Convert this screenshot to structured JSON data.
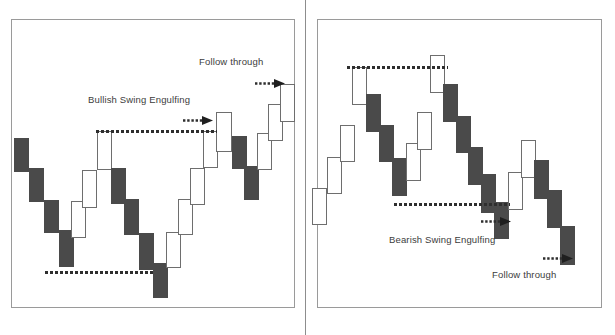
{
  "figure": {
    "title_left": "Bullish Swing Engulfing",
    "title_right": "Bearish Swing Engulfing",
    "follow_through_left": "Follow through",
    "follow_through_right": "Follow through",
    "colors": {
      "up_fill": "#ffffff",
      "up_border": "#6e6e6e",
      "down_fill": "#4a4a4a",
      "line": "#2e2e2e",
      "panel_border": "#9a9a9a",
      "text": "#3c3c3c"
    }
  },
  "chart_data": [
    {
      "type": "bar",
      "title": "Bullish Swing Engulfing",
      "panel": "left",
      "xlabel": "",
      "ylabel": "",
      "grid": false,
      "legend": "none",
      "notes": [
        {
          "text": "Bullish Swing Engulfing",
          "x": 88,
          "y": 94
        },
        {
          "text": "Follow through",
          "x": 199,
          "y": 56
        }
      ],
      "annotations": [
        {
          "kind": "dashed-level",
          "name": "swing-high-level",
          "x1": 96,
          "x2": 217,
          "y": 130
        },
        {
          "kind": "dashed-level",
          "name": "swing-low-level",
          "x1": 45,
          "x2": 155,
          "y": 271
        },
        {
          "kind": "arrow",
          "name": "engulfing-arrow",
          "x": 183,
          "y": 115,
          "direction": "right"
        },
        {
          "kind": "arrow",
          "name": "follow-through-arrow",
          "x": 255,
          "y": 78,
          "direction": "right"
        }
      ],
      "candles": [
        {
          "i": 1,
          "dir": "down",
          "x": 14,
          "y": 138,
          "w": 15,
          "h": 34
        },
        {
          "i": 2,
          "dir": "down",
          "x": 29,
          "y": 168,
          "w": 15,
          "h": 34
        },
        {
          "i": 3,
          "dir": "down",
          "x": 44,
          "y": 200,
          "w": 15,
          "h": 33
        },
        {
          "i": 4,
          "dir": "down",
          "x": 59,
          "y": 230,
          "w": 15,
          "h": 37
        },
        {
          "i": 5,
          "dir": "up",
          "x": 71,
          "y": 201,
          "w": 15,
          "h": 37
        },
        {
          "i": 6,
          "dir": "up",
          "x": 82,
          "y": 170,
          "w": 15,
          "h": 38
        },
        {
          "i": 7,
          "dir": "up",
          "x": 97,
          "y": 131,
          "w": 15,
          "h": 39
        },
        {
          "i": 8,
          "dir": "down",
          "x": 111,
          "y": 168,
          "w": 15,
          "h": 36
        },
        {
          "i": 9,
          "dir": "down",
          "x": 124,
          "y": 199,
          "w": 15,
          "h": 36
        },
        {
          "i": 10,
          "dir": "down",
          "x": 139,
          "y": 233,
          "w": 15,
          "h": 37
        },
        {
          "i": 11,
          "dir": "down",
          "x": 153,
          "y": 263,
          "w": 15,
          "h": 35
        },
        {
          "i": 12,
          "dir": "up",
          "x": 166,
          "y": 232,
          "w": 15,
          "h": 36
        },
        {
          "i": 13,
          "dir": "up",
          "x": 178,
          "y": 199,
          "w": 15,
          "h": 36
        },
        {
          "i": 14,
          "dir": "up",
          "x": 190,
          "y": 168,
          "w": 15,
          "h": 37
        },
        {
          "i": 15,
          "dir": "up",
          "x": 203,
          "y": 131,
          "w": 15,
          "h": 37
        },
        {
          "i": 16,
          "dir": "up",
          "x": 216,
          "y": 112,
          "w": 16,
          "h": 40
        },
        {
          "i": 17,
          "dir": "down",
          "x": 232,
          "y": 136,
          "w": 15,
          "h": 33
        },
        {
          "i": 18,
          "dir": "down",
          "x": 244,
          "y": 166,
          "w": 15,
          "h": 34
        },
        {
          "i": 19,
          "dir": "up",
          "x": 257,
          "y": 133,
          "w": 15,
          "h": 37
        },
        {
          "i": 20,
          "dir": "up",
          "x": 268,
          "y": 104,
          "w": 15,
          "h": 37
        },
        {
          "i": 21,
          "dir": "up",
          "x": 280,
          "y": 84,
          "w": 15,
          "h": 38
        }
      ]
    },
    {
      "type": "bar",
      "title": "Bearish Swing Engulfing",
      "panel": "right",
      "xlabel": "",
      "ylabel": "",
      "grid": false,
      "legend": "none",
      "notes": [
        {
          "text": "Bearish Swing Engulfing",
          "x": 389,
          "y": 234
        },
        {
          "text": "Follow through",
          "x": 492,
          "y": 269
        }
      ],
      "annotations": [
        {
          "kind": "dashed-level",
          "name": "swing-high-level",
          "x1": 347,
          "x2": 448,
          "y": 66
        },
        {
          "kind": "dashed-level",
          "name": "swing-low-level",
          "x1": 394,
          "x2": 510,
          "y": 203
        },
        {
          "kind": "arrow",
          "name": "engulfing-arrow",
          "x": 481,
          "y": 216,
          "direction": "right"
        },
        {
          "kind": "arrow",
          "name": "follow-through-arrow",
          "x": 543,
          "y": 253,
          "direction": "right"
        }
      ],
      "candles": [
        {
          "i": 1,
          "dir": "up",
          "x": 312,
          "y": 188,
          "w": 15,
          "h": 37
        },
        {
          "i": 2,
          "dir": "up",
          "x": 327,
          "y": 157,
          "w": 15,
          "h": 37
        },
        {
          "i": 3,
          "dir": "up",
          "x": 340,
          "y": 125,
          "w": 15,
          "h": 37
        },
        {
          "i": 4,
          "dir": "up",
          "x": 352,
          "y": 67,
          "w": 15,
          "h": 38
        },
        {
          "i": 5,
          "dir": "down",
          "x": 366,
          "y": 94,
          "w": 15,
          "h": 38
        },
        {
          "i": 6,
          "dir": "down",
          "x": 379,
          "y": 125,
          "w": 15,
          "h": 37
        },
        {
          "i": 7,
          "dir": "down",
          "x": 392,
          "y": 158,
          "w": 15,
          "h": 38
        },
        {
          "i": 8,
          "dir": "up",
          "x": 406,
          "y": 143,
          "w": 15,
          "h": 38
        },
        {
          "i": 9,
          "dir": "up",
          "x": 417,
          "y": 112,
          "w": 15,
          "h": 38
        },
        {
          "i": 10,
          "dir": "up",
          "x": 430,
          "y": 55,
          "w": 15,
          "h": 38
        },
        {
          "i": 11,
          "dir": "down",
          "x": 443,
          "y": 84,
          "w": 15,
          "h": 38
        },
        {
          "i": 12,
          "dir": "down",
          "x": 456,
          "y": 116,
          "w": 15,
          "h": 37
        },
        {
          "i": 13,
          "dir": "down",
          "x": 468,
          "y": 147,
          "w": 15,
          "h": 38
        },
        {
          "i": 14,
          "dir": "down",
          "x": 481,
          "y": 174,
          "w": 15,
          "h": 39
        },
        {
          "i": 15,
          "dir": "down",
          "x": 494,
          "y": 202,
          "w": 15,
          "h": 37
        },
        {
          "i": 16,
          "dir": "up",
          "x": 508,
          "y": 172,
          "w": 15,
          "h": 38
        },
        {
          "i": 17,
          "dir": "up",
          "x": 521,
          "y": 140,
          "w": 15,
          "h": 38
        },
        {
          "i": 18,
          "dir": "down",
          "x": 534,
          "y": 160,
          "w": 15,
          "h": 39
        },
        {
          "i": 19,
          "dir": "down",
          "x": 547,
          "y": 190,
          "w": 15,
          "h": 38
        },
        {
          "i": 20,
          "dir": "down",
          "x": 560,
          "y": 226,
          "w": 15,
          "h": 39
        }
      ]
    }
  ]
}
